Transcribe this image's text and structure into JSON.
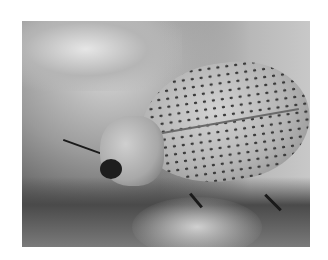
{
  "image": {
    "subject": "spotted beetle on fuzzy plant",
    "description": "Grayscale macro photograph of a beetle with pale, densely dark-spotted elytra resting on a hairy, fuzzy plant surface, framed by a white border"
  }
}
